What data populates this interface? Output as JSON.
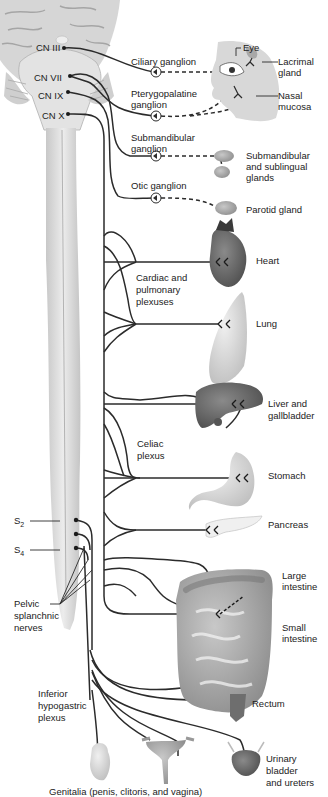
{
  "figure": {
    "cranial_nerves": [
      {
        "id": "cn3",
        "label": "CN III"
      },
      {
        "id": "cn7",
        "label": "CN VII"
      },
      {
        "id": "cn9",
        "label": "CN IX"
      },
      {
        "id": "cn10",
        "label": "CN X"
      }
    ],
    "ganglia": [
      {
        "id": "ciliary",
        "label": "Ciliary ganglion"
      },
      {
        "id": "pterygopalatine",
        "label_line1": "Pterygopalatine",
        "label_line2": "ganglion"
      },
      {
        "id": "submandibular",
        "label_line1": "Submandibular",
        "label_line2": "ganglion"
      },
      {
        "id": "otic",
        "label": "Otic ganglion"
      }
    ],
    "head_targets": {
      "eye": "Eye",
      "lacrimal_line1": "Lacrimal",
      "lacrimal_line2": "gland",
      "nasal_line1": "Nasal",
      "nasal_line2": "mucosa",
      "submand_line1": "Submandibular",
      "submand_line2": "and sublingual",
      "submand_line3": "glands",
      "parotid": "Parotid gland"
    },
    "plexuses": {
      "cardiac_line1": "Cardiac and",
      "cardiac_line2": "pulmonary",
      "cardiac_line3": "plexuses",
      "celiac_line1": "Celiac",
      "celiac_line2": "plexus",
      "inferior_line1": "Inferior",
      "inferior_line2": "hypogastric",
      "inferior_line3": "plexus"
    },
    "organs": {
      "heart": "Heart",
      "lung": "Lung",
      "liver_line1": "Liver and",
      "liver_line2": "gallbladder",
      "stomach": "Stomach",
      "pancreas": "Pancreas",
      "large_line1": "Large",
      "large_line2": "intestine",
      "small_line1": "Small",
      "small_line2": "intestine",
      "rectum": "Rectum",
      "bladder_line1": "Urinary",
      "bladder_line2": "bladder",
      "bladder_line3": "and ureters",
      "genitalia": "Genitalia (penis, clitoris, and vagina)"
    },
    "sacral": {
      "s2_base": "S",
      "s2_sub": "2",
      "s4_base": "S",
      "s4_sub": "4",
      "pelvic_line1": "Pelvic",
      "pelvic_line2": "splanchnic",
      "pelvic_line3": "nerves"
    },
    "colors": {
      "nerve": "#2b2b2b",
      "cord": "#d9d9d9",
      "organ_dark": "#6e6e6e",
      "organ_mid": "#a8a8a8",
      "organ_light": "#dcdcdc"
    }
  }
}
